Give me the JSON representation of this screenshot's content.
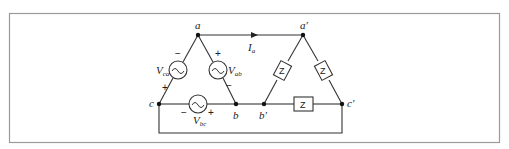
{
  "figure": {
    "frame_color": "#9a9a9a",
    "wire_color": "#333333",
    "nodes": {
      "a": "a",
      "b": "b",
      "c": "c",
      "a_prime": "a′",
      "b_prime": "b′",
      "c_prime": "c′"
    },
    "current": {
      "symbol": "I",
      "subscript": "a"
    },
    "sources": {
      "ca": {
        "symbol": "V",
        "subscript": "ca",
        "plus": "+",
        "minus": "−"
      },
      "ab": {
        "symbol": "V",
        "subscript": "ab",
        "plus": "+",
        "minus": "−"
      },
      "bc": {
        "symbol": "V",
        "subscript": "bc",
        "plus": "+",
        "minus": "−"
      }
    },
    "loads": {
      "left": "Z",
      "right": "Z",
      "bottom": "Z"
    }
  }
}
